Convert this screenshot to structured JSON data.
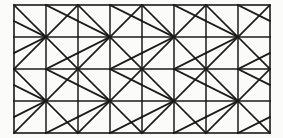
{
  "figure": {
    "background_color": "#fbfbf9",
    "line_color": "#1a1a1a",
    "border_color": "#1a1a1a",
    "grid": {
      "columns": 8,
      "rows": 4,
      "cell_width": 32,
      "cell_height": 32,
      "origin_x": 14,
      "origin_y": 5,
      "total_width": 256,
      "total_height": 128,
      "border_width": 1.6,
      "grid_line_width": 1.5,
      "diagonal_line_width": 1.7
    },
    "block": {
      "size": 2,
      "motif": "pinwheel",
      "cells": [
        {
          "position": "top-left",
          "col": 0,
          "row": 0,
          "full_diagonal": "main",
          "half_diagonal_from": "left-mid",
          "half_diagonal_to": "bottom-right"
        },
        {
          "position": "top-right",
          "col": 1,
          "row": 0,
          "full_diagonal": "anti",
          "half_diagonal_from": "top-left",
          "half_diagonal_to": "right-mid"
        },
        {
          "position": "bottom-left",
          "col": 0,
          "row": 1,
          "full_diagonal": "anti",
          "half_diagonal_from": "top-right",
          "half_diagonal_to": "left-mid"
        },
        {
          "position": "bottom-right",
          "col": 1,
          "row": 1,
          "full_diagonal": "main",
          "half_diagonal_from": "bottom-left",
          "half_diagonal_to": "right-mid"
        }
      ]
    }
  }
}
